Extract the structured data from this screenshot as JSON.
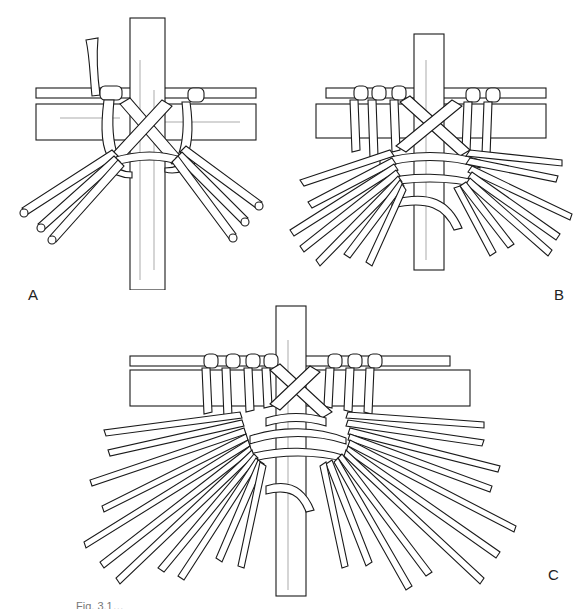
{
  "figure": {
    "caption": "Fig. 3.1…",
    "panels": [
      {
        "id": "A",
        "label": "A",
        "spokes_left": 3,
        "spokes_right": 3,
        "wraps_left": 1,
        "wraps_right": 1
      },
      {
        "id": "B",
        "label": "B",
        "spokes_left": 7,
        "spokes_right": 7,
        "wraps_left": 3,
        "wraps_right": 2
      },
      {
        "id": "C",
        "label": "C",
        "spokes_left": 12,
        "spokes_right": 12,
        "wraps_left": 4,
        "wraps_right": 3
      }
    ]
  },
  "colors": {
    "ink": "#1a1a1a",
    "paper": "#ffffff"
  }
}
